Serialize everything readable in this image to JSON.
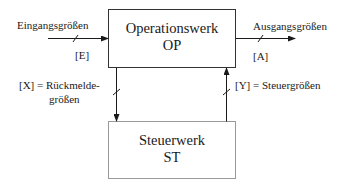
{
  "diagram": {
    "operationswerk": {
      "name": "Operationswerk",
      "abbr": "OP"
    },
    "steuerwerk": {
      "name": "Steuerwerk",
      "abbr": "ST"
    },
    "input": {
      "label": "Eingangsgrößen",
      "bus": "[E]"
    },
    "output": {
      "label": "Ausgangsgrößen",
      "bus": "[A]"
    },
    "feedback": {
      "line1": "[X] = Rückmelde-",
      "line2": "größen"
    },
    "control": {
      "label": "[Y] = Steuergrößen"
    }
  },
  "colors": {
    "line": "#1a1a1a",
    "box_border": "#333333",
    "bottom_box_border": "#999999"
  }
}
